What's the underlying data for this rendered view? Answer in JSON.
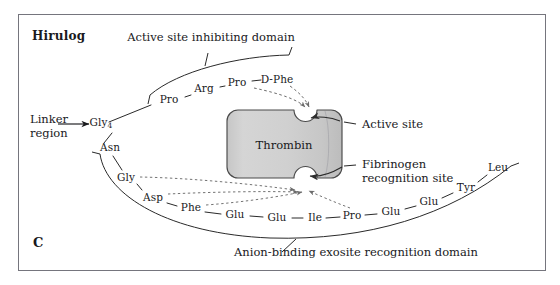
{
  "figure": {
    "panel_label": "C",
    "title": "Hirulog",
    "background_color": "#ffffff",
    "border_color": "#6f6f78",
    "ink_color": "#19191c"
  },
  "protein": {
    "name": "Thrombin",
    "fill_color": "#cccccc",
    "stroke_color": "#4a4a4a",
    "sites": [
      {
        "id": "active-site",
        "label": "Active site"
      },
      {
        "id": "fibrinogen-recognition-site",
        "label_line1": "Fibrinogen",
        "label_line2": "recognition site"
      }
    ]
  },
  "domains": {
    "active_site_inhibiting": "Active site inhibiting domain",
    "anion_binding_exosite": "Anion-binding exosite recognition domain",
    "linker_line1": "Linker",
    "linker_line2": "region"
  },
  "residues": {
    "linker": {
      "label": "Gly",
      "subscript": "4"
    },
    "inhibiting_chain": [
      {
        "label": "Pro",
        "x": 169,
        "y": 100
      },
      {
        "label": "Arg",
        "x": 204,
        "y": 89
      },
      {
        "label": "Pro",
        "x": 237,
        "y": 83
      },
      {
        "label": "D-Phe",
        "x": 277,
        "y": 80
      }
    ],
    "exosite_chain": [
      {
        "label": "Asn",
        "x": 110,
        "y": 148
      },
      {
        "label": "Gly",
        "x": 126,
        "y": 178
      },
      {
        "label": "Asp",
        "x": 153,
        "y": 198
      },
      {
        "label": "Phe",
        "x": 191,
        "y": 208
      },
      {
        "label": "Glu",
        "x": 235,
        "y": 215
      },
      {
        "label": "Glu",
        "x": 277,
        "y": 218
      },
      {
        "label": "Ile",
        "x": 315,
        "y": 218
      },
      {
        "label": "Pro",
        "x": 352,
        "y": 216
      },
      {
        "label": "Glu",
        "x": 391,
        "y": 212
      },
      {
        "label": "Glu",
        "x": 429,
        "y": 202
      },
      {
        "label": "Tyr",
        "x": 466,
        "y": 188
      },
      {
        "label": "Leu",
        "x": 498,
        "y": 168
      }
    ]
  }
}
